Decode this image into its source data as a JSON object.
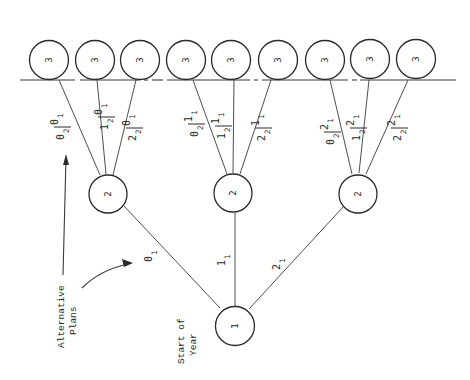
{
  "diagram": {
    "orientation": "rotated-90-ccw",
    "captions": {
      "start": [
        "Start of",
        "Year"
      ],
      "alternatives": [
        "Alternative",
        "Plans"
      ]
    },
    "root": {
      "id": "n1",
      "label": "1"
    },
    "level2": [
      {
        "id": "n2a",
        "label": "2",
        "edge_label": {
          "main": "0",
          "sub": "1"
        }
      },
      {
        "id": "n2b",
        "label": "2",
        "edge_label": {
          "main": "1",
          "sub": "1"
        }
      },
      {
        "id": "n2c",
        "label": "2",
        "edge_label": {
          "main": "2",
          "sub": "1"
        }
      }
    ],
    "level3": [
      {
        "id": "n3a",
        "label": "3",
        "parent": "n2a",
        "edge_label": {
          "top": "0",
          "top_sub": "1",
          "bottom": "0",
          "bottom_sub": "2"
        }
      },
      {
        "id": "n3b",
        "label": "3",
        "parent": "n2a",
        "edge_label": {
          "top": "0",
          "top_sub": "1",
          "bottom": "1",
          "bottom_sub": "2"
        }
      },
      {
        "id": "n3c",
        "label": "3",
        "parent": "n2a",
        "edge_label": {
          "top": "0",
          "top_sub": "1",
          "bottom": "2",
          "bottom_sub": "2"
        }
      },
      {
        "id": "n3d",
        "label": "3",
        "parent": "n2b",
        "edge_label": {
          "top": "1",
          "top_sub": "1",
          "bottom": "0",
          "bottom_sub": "2"
        }
      },
      {
        "id": "n3e",
        "label": "3",
        "parent": "n2b",
        "edge_label": {
          "top": "1",
          "top_sub": "1",
          "bottom": "1",
          "bottom_sub": "2"
        }
      },
      {
        "id": "n3f",
        "label": "3",
        "parent": "n2b",
        "edge_label": {
          "top": "1",
          "top_sub": "1",
          "bottom": "2",
          "bottom_sub": "2"
        }
      },
      {
        "id": "n3g",
        "label": "3",
        "parent": "n2c",
        "edge_label": {
          "top": "2",
          "top_sub": "1",
          "bottom": "0",
          "bottom_sub": "2"
        }
      },
      {
        "id": "n3h",
        "label": "3",
        "parent": "n2c",
        "edge_label": {
          "top": "2",
          "top_sub": "1",
          "bottom": "1",
          "bottom_sub": "2"
        }
      },
      {
        "id": "n3i",
        "label": "3",
        "parent": "n2c",
        "edge_label": {
          "top": "2",
          "top_sub": "1",
          "bottom": "2",
          "bottom_sub": "2"
        }
      }
    ]
  }
}
